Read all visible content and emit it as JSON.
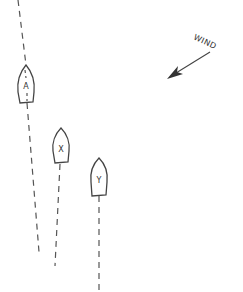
{
  "diagram": {
    "title": "",
    "boats": [
      {
        "id": "A",
        "label": "A",
        "cx": 26,
        "top": 65,
        "bottom": 103,
        "half_width": 8,
        "track": {
          "x1": 18,
          "y1": 0,
          "x2": 39,
          "y2": 252
        }
      },
      {
        "id": "X",
        "label": "X",
        "cx": 61,
        "top": 128,
        "bottom": 164,
        "half_width": 8,
        "track": {
          "x1": 60,
          "y1": 164,
          "x2": 55,
          "y2": 266
        }
      },
      {
        "id": "Y",
        "label": "Y",
        "cx": 99,
        "top": 158,
        "bottom": 196,
        "half_width": 8,
        "track": {
          "x1": 99,
          "y1": 196,
          "x2": 99,
          "y2": 290
        }
      }
    ],
    "wind": {
      "label": "WIND",
      "from": {
        "x": 210,
        "y": 52
      },
      "to": {
        "x": 167,
        "y": 78
      },
      "label_x": 193,
      "label_y": 39,
      "label_rotation": 25
    },
    "colors": {
      "line": "#444444",
      "background": "#ffffff"
    }
  }
}
